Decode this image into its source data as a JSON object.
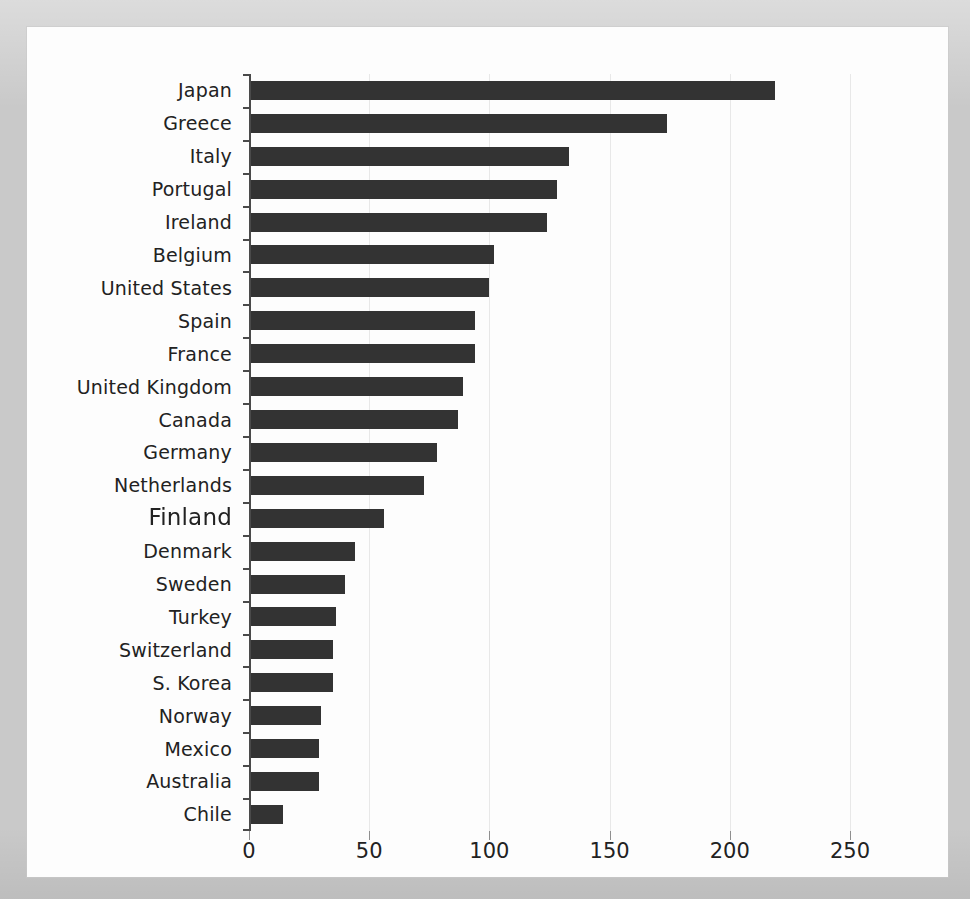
{
  "chart_data": {
    "type": "bar",
    "orientation": "horizontal",
    "title": "",
    "subtitle": "",
    "xlabel": "",
    "ylabel": "",
    "xlim": [
      0,
      260
    ],
    "ylim": null,
    "grid": "vertical",
    "legend": null,
    "bar_color": "#333333",
    "background_color": "#fdfdfd",
    "frame_color": "#c9c9c9",
    "gridline_color": "#e8e8e8",
    "axis_color": "#4a4a4a",
    "xticks": [
      0,
      50,
      100,
      150,
      200,
      250
    ],
    "xtick_labels": [
      "0",
      "50",
      "100",
      "150",
      "200",
      "250"
    ],
    "categories": [
      "Japan",
      "Greece",
      "Italy",
      "Portugal",
      "Ireland",
      "Belgium",
      "United States",
      "Spain",
      "France",
      "United Kingdom",
      "Canada",
      "Germany",
      "Netherlands",
      "Finland",
      "Denmark",
      "Sweden",
      "Turkey",
      "Switzerland",
      "S. Korea",
      "Norway",
      "Mexico",
      "Australia",
      "Chile"
    ],
    "values": [
      219,
      174,
      133,
      128,
      124,
      102,
      100,
      94,
      94,
      89,
      87,
      78,
      73,
      56,
      44,
      40,
      36,
      35,
      35,
      30,
      29,
      29,
      14
    ],
    "annotations": [
      {
        "target": "Finland",
        "note": "label rendered at larger size with scan smear artifact"
      }
    ]
  }
}
